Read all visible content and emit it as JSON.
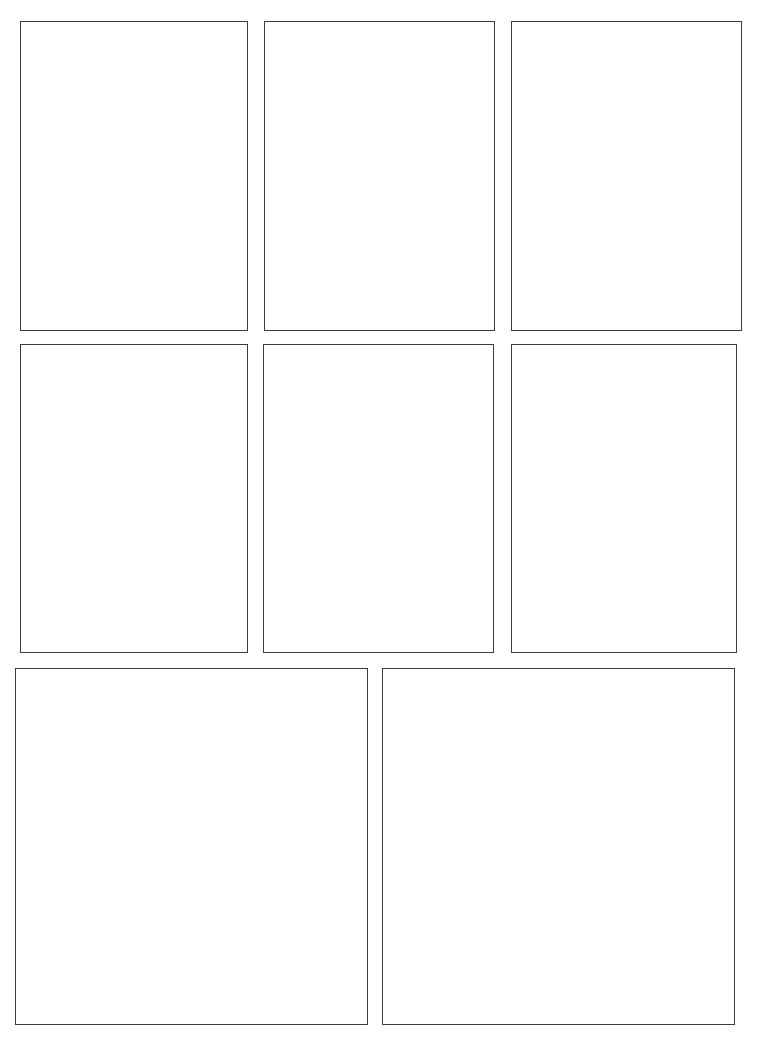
{
  "page": {
    "background_color": "#ffffff",
    "width": 768,
    "height": 1052,
    "border_color": "#3c3c3c",
    "border_width_px": 1.4,
    "panel_fill_color": "#ffffff",
    "row_count": 3,
    "panel_count": 8
  },
  "rows": [
    {
      "name": "row-1",
      "panel_count": 3,
      "top": 21,
      "bottom": 331
    },
    {
      "name": "row-2",
      "panel_count": 3,
      "top": 344,
      "bottom": 653
    },
    {
      "name": "row-3",
      "panel_count": 2,
      "top": 668,
      "bottom": 1025
    }
  ],
  "panels": [
    {
      "id": "panel-1",
      "row": 1,
      "column": 1,
      "x": 20,
      "y": 21,
      "width": 228,
      "height": 310,
      "content": ""
    },
    {
      "id": "panel-2",
      "row": 1,
      "column": 2,
      "x": 264,
      "y": 21,
      "width": 231,
      "height": 310,
      "content": ""
    },
    {
      "id": "panel-3",
      "row": 1,
      "column": 3,
      "x": 511,
      "y": 21,
      "width": 231,
      "height": 310,
      "content": ""
    },
    {
      "id": "panel-4",
      "row": 2,
      "column": 1,
      "x": 20,
      "y": 344,
      "width": 228,
      "height": 309,
      "content": ""
    },
    {
      "id": "panel-5",
      "row": 2,
      "column": 2,
      "x": 263,
      "y": 344,
      "width": 231,
      "height": 309,
      "content": ""
    },
    {
      "id": "panel-6",
      "row": 2,
      "column": 3,
      "x": 511,
      "y": 344,
      "width": 226,
      "height": 309,
      "content": ""
    },
    {
      "id": "panel-7",
      "row": 3,
      "column": 1,
      "x": 15,
      "y": 668,
      "width": 353,
      "height": 357,
      "content": ""
    },
    {
      "id": "panel-8",
      "row": 3,
      "column": 2,
      "x": 382,
      "y": 668,
      "width": 353,
      "height": 357,
      "content": ""
    }
  ]
}
